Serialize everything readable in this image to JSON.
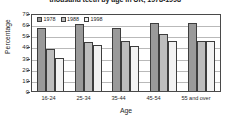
{
  "chart_data": {
    "type": "bar",
    "title": "thousand teeth by age in UK, 1978-1998",
    "xlabel": "Age",
    "ylabel": "Percentage",
    "ylim": [
      0,
      70
    ],
    "yticks": [
      70,
      60,
      50,
      40,
      30,
      20,
      10,
      0
    ],
    "grid": true,
    "legend_position": "top-left-inside",
    "categories": [
      "16-24",
      "25-34",
      "35-44",
      "45-54",
      "55 and over"
    ],
    "series": [
      {
        "name": "1978",
        "color": "#9a9a9a",
        "values": [
          57,
          60,
          57,
          61,
          61
        ]
      },
      {
        "name": "1988",
        "color": "#bdbdbd",
        "values": [
          38,
          44,
          45,
          51,
          45
        ]
      },
      {
        "name": "1998",
        "color": "#f2f2f2",
        "values": [
          30,
          41,
          40,
          45,
          45
        ]
      }
    ]
  }
}
